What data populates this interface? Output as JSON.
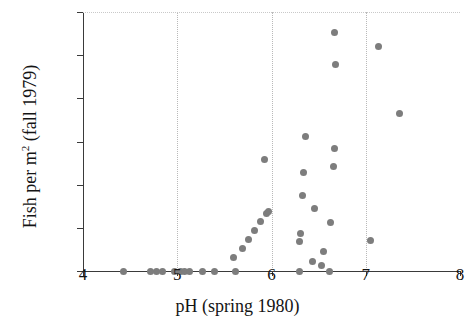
{
  "chart_data": {
    "type": "scatter",
    "title": "",
    "xlabel": "pH (spring 1980)",
    "ylabel": "Fish per m² (fall 1979)",
    "ylabel_prefix": "Fish per m",
    "ylabel_sup": "2",
    "ylabel_suffix": " (fall 1979)",
    "xlim": [
      4,
      8
    ],
    "ylim": [
      0,
      0.6
    ],
    "xticks": [
      4,
      5,
      6,
      7,
      8
    ],
    "xticklabels": [
      "4",
      "5",
      "6",
      "7",
      "8"
    ],
    "yticks": [
      0,
      0.1,
      0.2,
      0.3,
      0.4,
      0.5,
      0.6
    ],
    "yticklabels": [
      "0",
      "0.1",
      "0.2",
      "0.3",
      "0.4",
      "0.5",
      "0.6"
    ],
    "grid": "dotted vertical gridlines at x = 5, 6, 7 and horizontal dotted line at y = 0.6",
    "gridlines_v": [
      5,
      6,
      7
    ],
    "gridlines_h": [
      0.6
    ],
    "marker_color": "#7d7d7d",
    "marker_shape": "circle",
    "legend": "none",
    "points": [
      {
        "x": 4.43,
        "y": 0.0
      },
      {
        "x": 4.72,
        "y": 0.0
      },
      {
        "x": 4.78,
        "y": 0.0
      },
      {
        "x": 4.84,
        "y": 0.0
      },
      {
        "x": 4.97,
        "y": 0.0
      },
      {
        "x": 5.03,
        "y": 0.0
      },
      {
        "x": 5.08,
        "y": 0.0
      },
      {
        "x": 5.13,
        "y": 0.0
      },
      {
        "x": 5.27,
        "y": 0.0
      },
      {
        "x": 5.39,
        "y": 0.0
      },
      {
        "x": 5.62,
        "y": 0.0
      },
      {
        "x": 5.6,
        "y": 0.032
      },
      {
        "x": 5.69,
        "y": 0.052
      },
      {
        "x": 5.76,
        "y": 0.073
      },
      {
        "x": 5.82,
        "y": 0.094
      },
      {
        "x": 5.88,
        "y": 0.115
      },
      {
        "x": 5.95,
        "y": 0.133
      },
      {
        "x": 5.97,
        "y": 0.137
      },
      {
        "x": 5.93,
        "y": 0.258
      },
      {
        "x": 6.3,
        "y": 0.0
      },
      {
        "x": 6.3,
        "y": 0.068
      },
      {
        "x": 6.31,
        "y": 0.088
      },
      {
        "x": 6.33,
        "y": 0.176
      },
      {
        "x": 6.34,
        "y": 0.228
      },
      {
        "x": 6.36,
        "y": 0.312
      },
      {
        "x": 6.43,
        "y": 0.022
      },
      {
        "x": 6.46,
        "y": 0.145
      },
      {
        "x": 6.53,
        "y": 0.012
      },
      {
        "x": 6.55,
        "y": 0.046
      },
      {
        "x": 6.62,
        "y": 0.0
      },
      {
        "x": 6.63,
        "y": 0.113
      },
      {
        "x": 6.66,
        "y": 0.243
      },
      {
        "x": 6.67,
        "y": 0.284
      },
      {
        "x": 6.68,
        "y": 0.478
      },
      {
        "x": 6.67,
        "y": 0.553
      },
      {
        "x": 7.05,
        "y": 0.07
      },
      {
        "x": 7.13,
        "y": 0.521
      },
      {
        "x": 7.36,
        "y": 0.365
      }
    ]
  }
}
